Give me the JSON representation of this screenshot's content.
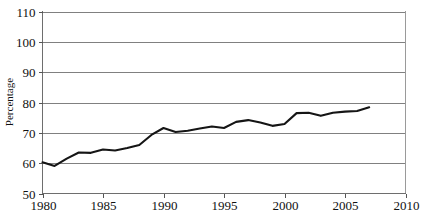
{
  "chart_data": {
    "type": "line",
    "title": "",
    "xlabel": "",
    "ylabel": "Percentage",
    "xlim": [
      1980,
      2010
    ],
    "ylim": [
      50,
      110
    ],
    "grid": true,
    "legend": false,
    "legend_position": "none",
    "xticks": [
      1980,
      1985,
      1990,
      1995,
      2000,
      2005,
      2010
    ],
    "yticks": [
      50,
      60,
      70,
      80,
      90,
      100,
      110
    ],
    "xtick_labels": [
      "1980",
      "1985",
      "1990",
      "1995",
      "2000",
      "2005",
      "2010"
    ],
    "ytick_labels": [
      "50",
      "60",
      "70",
      "80",
      "90",
      "100",
      "110"
    ],
    "line_color": "#151515",
    "grid_color": "#808080",
    "x": [
      1980,
      1981,
      1982,
      1983,
      1984,
      1985,
      1986,
      1987,
      1988,
      1989,
      1990,
      1991,
      1992,
      1993,
      1994,
      1995,
      1996,
      1997,
      1998,
      1999,
      2000,
      2001,
      2002,
      2003,
      2004,
      2005,
      2006,
      2007
    ],
    "series": [
      {
        "name": "Percentage",
        "values": [
          60.3,
          59.1,
          61.5,
          63.5,
          63.4,
          64.5,
          64.2,
          65.0,
          66.0,
          69.3,
          71.6,
          70.3,
          70.7,
          71.4,
          72.1,
          71.6,
          73.6,
          74.2,
          73.4,
          72.3,
          72.9,
          76.5,
          76.6,
          75.6,
          76.6,
          77.0,
          77.2,
          78.4
        ]
      }
    ]
  },
  "axes": {
    "y_axis_title": "Percentage"
  }
}
